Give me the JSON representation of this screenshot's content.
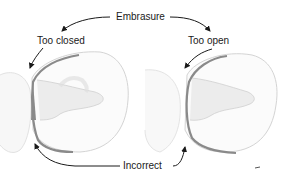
{
  "labels": {
    "top": "Embrasure",
    "left": "Too closed",
    "right": "Too open",
    "bottom": "Incorrect"
  },
  "colors": {
    "band": "#8a8a8a",
    "band_dark": "#6e6e6e",
    "tooth_outline": "#d6d6d6",
    "tooth_shade": "#e6e6e6",
    "arrow": "#1a1a1a"
  }
}
